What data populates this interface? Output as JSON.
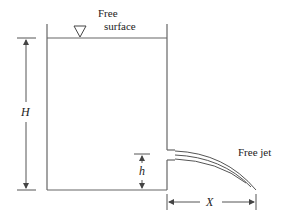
{
  "diagram": {
    "type": "tank-with-orifice-free-jet",
    "labels": {
      "free_surface_line1": "Free",
      "free_surface_line2": "surface",
      "height_total": "H",
      "orifice_height": "h",
      "jet_distance": "X",
      "free_jet": "Free jet"
    },
    "symbols": {
      "free_surface_marker": "inverted-triangle"
    },
    "colors": {
      "line": "#555555",
      "text": "#222222",
      "background": "#ffffff"
    }
  }
}
